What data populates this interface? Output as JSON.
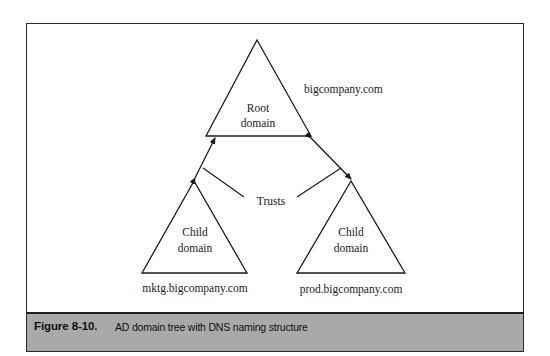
{
  "diagram": {
    "title": "AD domain tree with DNS naming structure",
    "root": {
      "label_line1": "Root",
      "label_line2": "domain",
      "dns_name": "bigcompany.com"
    },
    "children": [
      {
        "label_line1": "Child",
        "label_line2": "domain",
        "dns_name": "mktg.bigcompany.com"
      },
      {
        "label_line1": "Child",
        "label_line2": "domain",
        "dns_name": "prod.bigcompany.com"
      }
    ],
    "trusts_label": "Trusts"
  },
  "caption": {
    "number": "Figure 8-10.",
    "text": "AD domain tree with DNS naming structure"
  },
  "colors": {
    "line": "#1a1a1a",
    "caption_band": "#a9a9a9",
    "frame_border": "#2a2a2a"
  }
}
